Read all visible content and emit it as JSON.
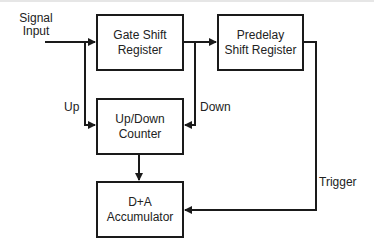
{
  "diagram": {
    "type": "block-diagram",
    "colors": {
      "line": "#1a1a1a",
      "text": "#222222",
      "background": "#ffffff"
    },
    "input_label": {
      "line1": "Signal",
      "line2": "Input"
    },
    "blocks": {
      "gate_shift_register": {
        "line1": "Gate Shift",
        "line2": "Register"
      },
      "predelay_shift_register": {
        "line1": "Predelay",
        "line2": "Shift Register"
      },
      "up_down_counter": {
        "line1": "Up/Down",
        "line2": "Counter"
      },
      "accumulator": {
        "line1": "D+A",
        "line2": "Accumulator"
      }
    },
    "edge_labels": {
      "up": "Up",
      "down": "Down",
      "trigger": "Trigger"
    },
    "edges": [
      {
        "from": "Signal Input",
        "to": "Gate Shift Register"
      },
      {
        "from": "Signal Input",
        "to": "Up/Down Counter",
        "label": "Up"
      },
      {
        "from": "Gate Shift Register",
        "to": "Predelay Shift Register"
      },
      {
        "from": "Gate Shift Register",
        "to": "Up/Down Counter",
        "label": "Down"
      },
      {
        "from": "Up/Down Counter",
        "to": "D+A Accumulator"
      },
      {
        "from": "Predelay Shift Register",
        "to": "D+A Accumulator",
        "label": "Trigger"
      }
    ]
  }
}
